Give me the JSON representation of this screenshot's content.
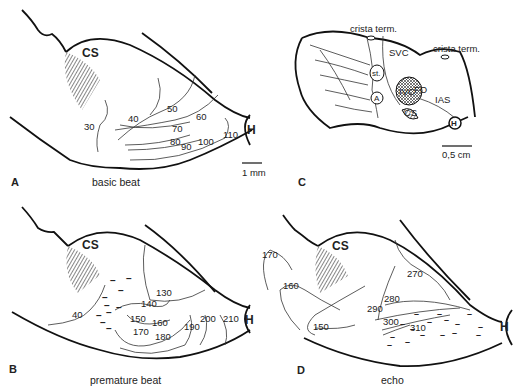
{
  "figure": {
    "panels": [
      {
        "id": "A",
        "caption": "basic beat",
        "structures": [
          "CS",
          "H"
        ],
        "scale_bar": "1 mm",
        "isochrones": [
          "30",
          "40",
          "50",
          "60",
          "70",
          "80",
          "90",
          "100",
          "110"
        ]
      },
      {
        "id": "B",
        "caption": "premature beat",
        "structures": [
          "CS",
          "H"
        ],
        "isochrones": [
          "40",
          "130",
          "140",
          "150",
          "160",
          "170",
          "180",
          "190",
          "200",
          "210"
        ]
      },
      {
        "id": "C",
        "caption": "",
        "labels": [
          "crista term.",
          "crista term.",
          "SVC",
          "st.",
          "A",
          "IVC",
          "FO",
          "IAS",
          "CS",
          "H"
        ],
        "scale_bar": "0,5 cm"
      },
      {
        "id": "D",
        "caption": "echo",
        "structures": [
          "CS",
          "H"
        ],
        "isochrones": [
          "150",
          "160",
          "170",
          "270",
          "280",
          "290",
          "300",
          "310"
        ]
      }
    ]
  }
}
